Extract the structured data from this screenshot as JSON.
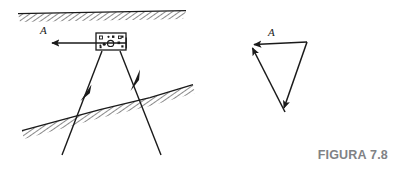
{
  "figure": {
    "caption": "FIGURA 7.8",
    "caption_color": "#808285",
    "background_color": "#ffffff",
    "ink_color": "#1a1a1a",
    "width": 394,
    "height": 170
  },
  "left_diagram": {
    "name": "seismic-refraction-survey-sketch",
    "vector_label": "A",
    "ground_surface": {
      "label": "ground-surface-hatched-band",
      "start": [
        18,
        14
      ],
      "end": [
        186,
        11
      ],
      "hatch_side": "below"
    },
    "interface": {
      "label": "dipping-interface-hatched-band",
      "start": [
        22,
        131
      ],
      "end": [
        193,
        85
      ],
      "hatch_side": "below"
    },
    "instrument_box": {
      "label": "instrument-box",
      "x": 96,
      "y": 33,
      "width": 30,
      "height": 17,
      "markers": 8
    },
    "arrow_left": {
      "label": "arrow-A-left",
      "from": [
        126,
        43
      ],
      "to": [
        50,
        43
      ]
    },
    "ray_left": {
      "label": "ray-left-downward",
      "from": [
        102,
        51
      ],
      "to": [
        62,
        155
      ],
      "arrow_at": [
        86,
        92
      ],
      "arrow_direction": "down-left"
    },
    "ray_right": {
      "label": "ray-right-upward",
      "from": [
        120,
        51
      ],
      "to": [
        160,
        155
      ],
      "arrow_at": [
        136,
        78
      ],
      "arrow_direction": "up-left"
    }
  },
  "right_diagram": {
    "name": "vector-triangle",
    "vector_label": "A",
    "vertices": {
      "top_left": [
        250,
        45
      ],
      "top_right": [
        307,
        42
      ],
      "bottom": [
        285,
        113
      ]
    },
    "edges": [
      {
        "label": "edge-top-resultant",
        "from": [
          307,
          42
        ],
        "to": [
          250,
          45
        ],
        "arrow": "at-end"
      },
      {
        "label": "edge-left-upward",
        "from": [
          285,
          113
        ],
        "to": [
          250,
          45
        ],
        "arrow": "at-end"
      },
      {
        "label": "edge-right-downward",
        "from": [
          307,
          42
        ],
        "to": [
          285,
          113
        ],
        "arrow": "at-end"
      }
    ],
    "label_position": [
      272,
      33
    ]
  }
}
